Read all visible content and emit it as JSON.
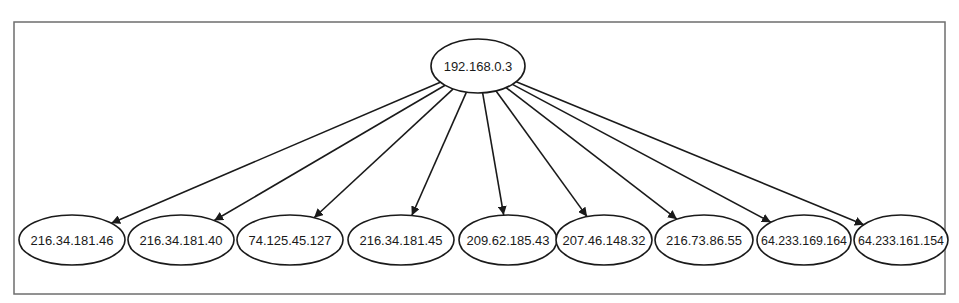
{
  "diagram": {
    "type": "directed-tree",
    "colors": {
      "stroke": "#1a1a1a",
      "frame": "#6e6e6e",
      "background": "#ffffff"
    },
    "frame": {
      "x": 14,
      "y": 22,
      "width": 931,
      "height": 272
    },
    "root": {
      "id": "root",
      "label": "192.168.0.3",
      "cx": 478,
      "cy": 66,
      "rx": 47,
      "ry": 27
    },
    "children": [
      {
        "id": "c0",
        "label": "216.34.181.46",
        "cx": 72,
        "cy": 240,
        "rx": 53,
        "ry": 25
      },
      {
        "id": "c1",
        "label": "216.34.181.40",
        "cx": 181,
        "cy": 240,
        "rx": 53,
        "ry": 25
      },
      {
        "id": "c2",
        "label": "74.125.45.127",
        "cx": 290,
        "cy": 240,
        "rx": 53,
        "ry": 25
      },
      {
        "id": "c3",
        "label": "216.34.181.45",
        "cx": 401,
        "cy": 240,
        "rx": 53,
        "ry": 25
      },
      {
        "id": "c4",
        "label": "209.62.185.43",
        "cx": 508,
        "cy": 240,
        "rx": 49,
        "ry": 25
      },
      {
        "id": "c5",
        "label": "207.46.148.32",
        "cx": 604,
        "cy": 240,
        "rx": 48,
        "ry": 25
      },
      {
        "id": "c6",
        "label": "216.73.86.55",
        "cx": 704,
        "cy": 240,
        "rx": 49,
        "ry": 25
      },
      {
        "id": "c7",
        "label": "64.233.169.164",
        "cx": 804,
        "cy": 240,
        "rx": 47,
        "ry": 25
      },
      {
        "id": "c8",
        "label": "64.233.161.154",
        "cx": 901,
        "cy": 240,
        "rx": 47,
        "ry": 25
      }
    ],
    "edges": [
      {
        "from": "root",
        "to": "c0"
      },
      {
        "from": "root",
        "to": "c1"
      },
      {
        "from": "root",
        "to": "c2"
      },
      {
        "from": "root",
        "to": "c3"
      },
      {
        "from": "root",
        "to": "c4"
      },
      {
        "from": "root",
        "to": "c5"
      },
      {
        "from": "root",
        "to": "c6"
      },
      {
        "from": "root",
        "to": "c7"
      },
      {
        "from": "root",
        "to": "c8"
      }
    ]
  }
}
